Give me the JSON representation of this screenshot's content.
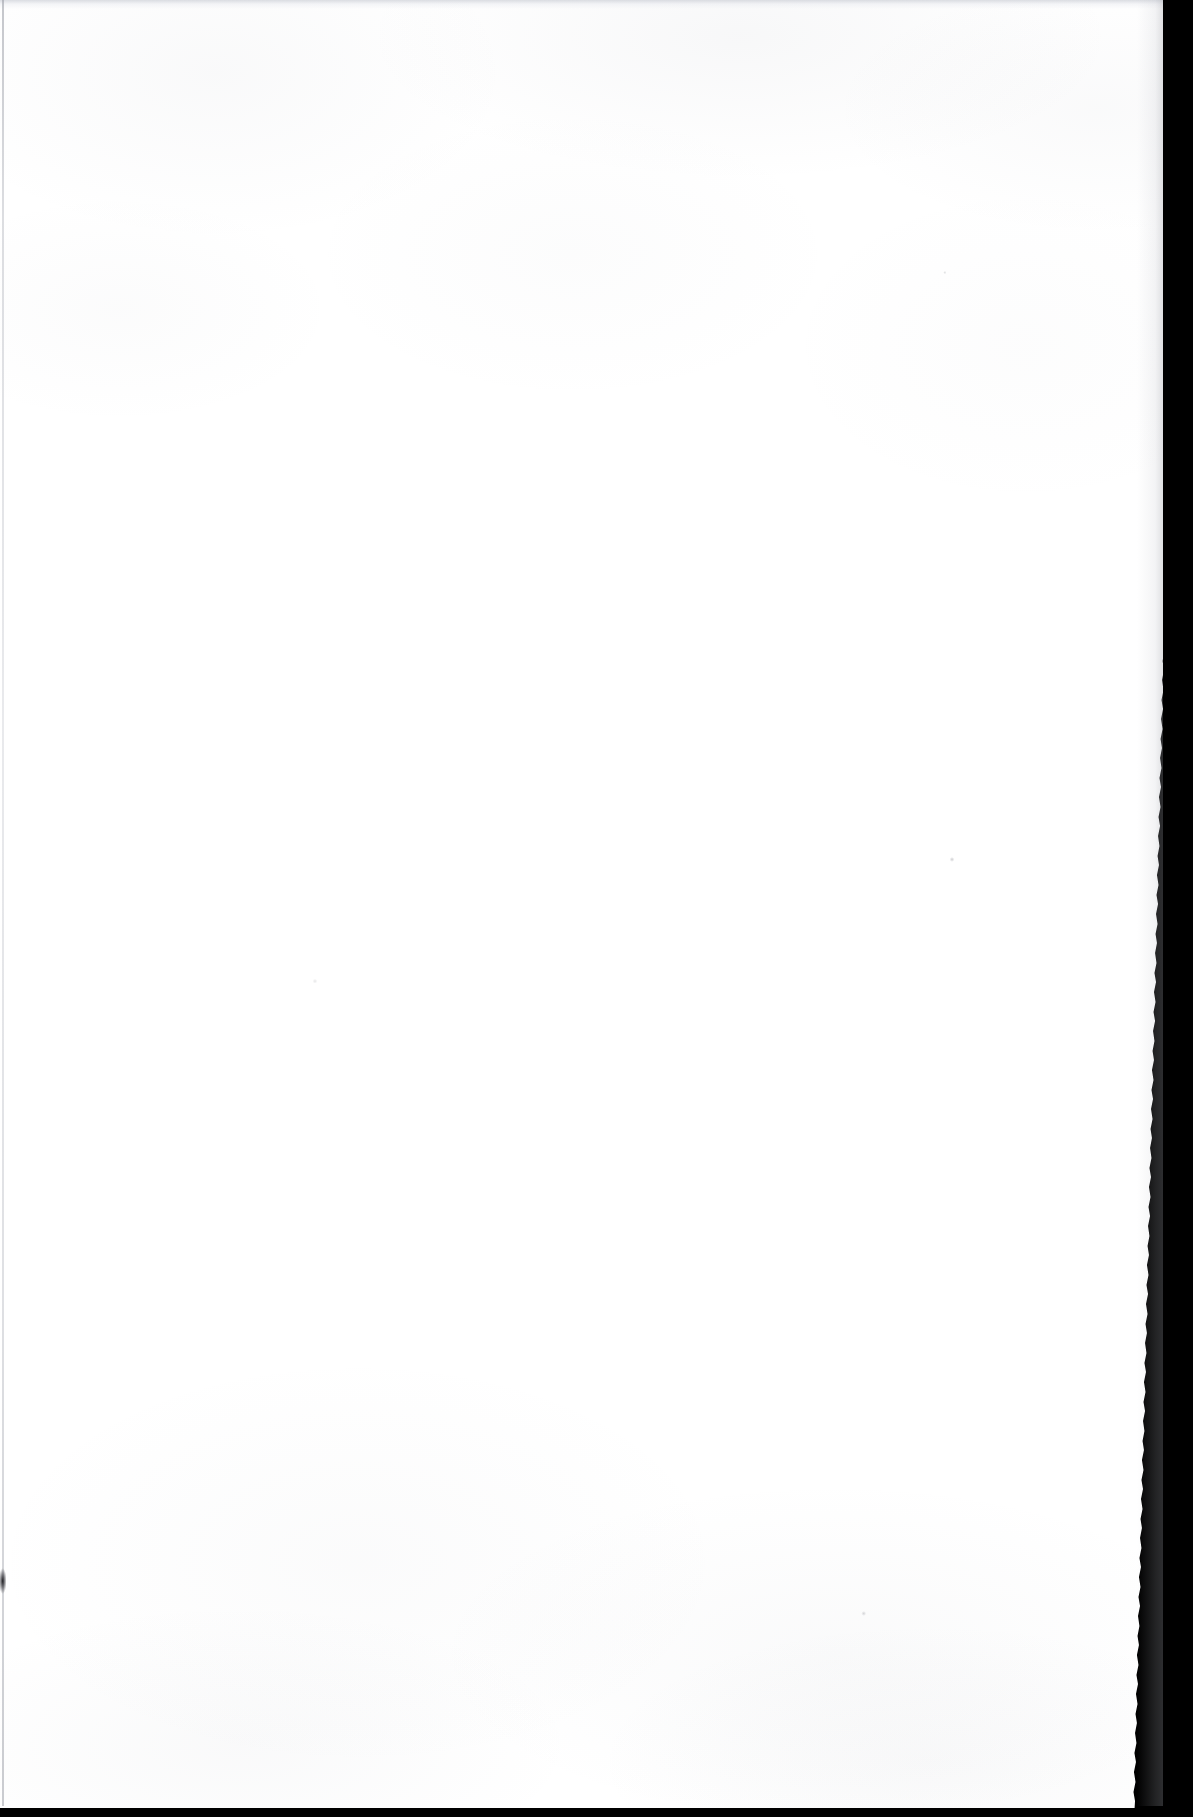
{
  "document": {
    "kind": "scanned-page",
    "page_content": "",
    "is_blank": true,
    "visible_text": [],
    "notes": "Blank scanned leaf; no printed text, figures, captions, folios or marginalia are rendered in the pixels."
  },
  "canvas": {
    "width_px": 1193,
    "height_px": 1817
  },
  "colors": {
    "paper": "#ffffff",
    "scanner_void": "#000000",
    "edge_shadow": "#96999f",
    "texture_tint": "#787d8c",
    "smudge": "#141418"
  },
  "page_geometry": {
    "paper_left_px": 0,
    "paper_top_px": 0,
    "paper_right_top_px": 1182,
    "paper_right_bottom_px": 1166,
    "paper_bottom_px": 1810,
    "right_edge_type": "ragged-torn-deckle",
    "bottom_edge_type": "straight-cut"
  },
  "artifacts": {
    "top_band": {
      "height_px": 9,
      "description": "faint light-gray band along the top edge of the sheet"
    },
    "left_gutter_line": {
      "x_px": 2,
      "width_px": 2,
      "description": "thin gray vertical rule down the extreme left margin"
    },
    "left_smudge": {
      "x_px": 0,
      "y_px": 1568,
      "width_px": 6,
      "height_px": 26,
      "description": "small dark speck on the left margin"
    },
    "right_void": {
      "description": "black scanner background visible beyond the torn right edge"
    },
    "bottom_void": {
      "height_px": 9,
      "description": "black scanner background strip below the sheet"
    },
    "paper_texture": {
      "description": "very faint mottled paper grain, strongest near the top and bottom edges"
    }
  }
}
